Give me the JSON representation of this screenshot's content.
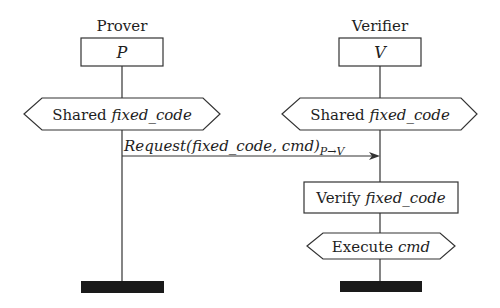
{
  "diagram": {
    "type": "sequence-protocol",
    "colors": {
      "stroke": "#333333",
      "text": "#1e1e1e",
      "terminator": "#1a1a1a",
      "background": "#ffffff"
    },
    "participants": [
      {
        "id": "prover",
        "label": "Prover",
        "symbol": "P",
        "steps": [
          {
            "shape": "hexagon",
            "prefix": "Shared ",
            "emphasis": "fixed_code"
          }
        ]
      },
      {
        "id": "verifier",
        "label": "Verifier",
        "symbol": "V",
        "steps": [
          {
            "shape": "hexagon",
            "prefix": "Shared ",
            "emphasis": "fixed_code"
          },
          {
            "shape": "rectangle",
            "prefix": "Verify ",
            "emphasis": "fixed_code"
          },
          {
            "shape": "hexagon",
            "prefix": "Execute ",
            "emphasis": "cmd"
          }
        ]
      }
    ],
    "messages": [
      {
        "from": "prover",
        "to": "verifier",
        "label": "Request(fixed_code, cmd)",
        "subscript": "P→V"
      }
    ]
  }
}
